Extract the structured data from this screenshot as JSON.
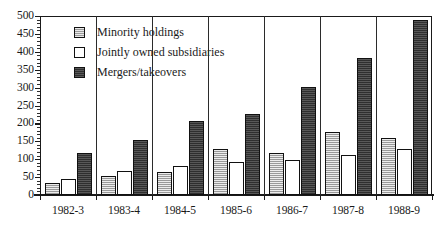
{
  "chart_data": {
    "type": "bar",
    "title": "",
    "xlabel": "",
    "ylabel": "",
    "categories": [
      "1982-3",
      "1983-4",
      "1984-5",
      "1985-6",
      "1986-7",
      "1987-8",
      "1988-9"
    ],
    "series": [
      {
        "name": "Minority holdings",
        "key": "minority",
        "color": "#b4b4b4",
        "values": [
          33,
          52,
          65,
          129,
          117,
          177,
          159
        ]
      },
      {
        "name": "Jointly owned subsidiaries",
        "key": "jointly",
        "color": "#ffffff",
        "values": [
          45,
          68,
          81,
          91,
          97,
          112,
          128
        ]
      },
      {
        "name": "Mergers/takeovers",
        "key": "mergers",
        "color": "#454545",
        "values": [
          116,
          155,
          207,
          226,
          302,
          382,
          490
        ]
      }
    ],
    "ylim": [
      0,
      500
    ],
    "ytick_step": 50,
    "yticks": [
      0,
      50,
      100,
      150,
      200,
      250,
      300,
      350,
      400,
      450,
      500
    ],
    "ytick_labels": [
      "0",
      "50",
      "100",
      "150",
      "200",
      "250",
      "300",
      "350",
      "400",
      "450",
      "500"
    ],
    "grid": false,
    "group_dividers": true,
    "legend_position": "top-left",
    "legend": [
      "Minority holdings",
      "Jointly owned subsidiaries",
      "Mergers/takeovers"
    ]
  }
}
